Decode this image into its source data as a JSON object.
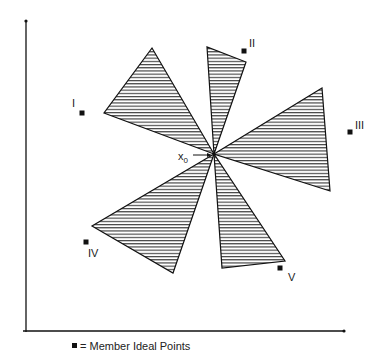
{
  "figure": {
    "center_label": "x",
    "center_subscript": "0",
    "legend_symbol": "square-marker",
    "legend_text": "= Member Ideal Points",
    "colors": {
      "line": "#111111",
      "hatch": "#222222",
      "background": "#ffffff"
    }
  },
  "ideal_points": [
    {
      "label": "I",
      "x": 82,
      "y": 113
    },
    {
      "label": "II",
      "x": 244,
      "y": 51
    },
    {
      "label": "III",
      "x": 350,
      "y": 132
    },
    {
      "label": "IV",
      "x": 86,
      "y": 242
    },
    {
      "label": "V",
      "x": 280,
      "y": 268
    }
  ],
  "center": {
    "x": 214,
    "y": 154
  },
  "triangles": [
    {
      "for": "I",
      "points": [
        [
          214,
          154
        ],
        [
          104,
          113
        ],
        [
          152,
          48
        ]
      ]
    },
    {
      "for": "II",
      "points": [
        [
          214,
          154
        ],
        [
          207,
          47
        ],
        [
          246,
          62
        ]
      ]
    },
    {
      "for": "III",
      "points": [
        [
          214,
          154
        ],
        [
          322,
          88
        ],
        [
          330,
          191
        ]
      ]
    },
    {
      "for": "IV",
      "points": [
        [
          214,
          154
        ],
        [
          92,
          226
        ],
        [
          173,
          273
        ]
      ]
    },
    {
      "for": "V",
      "points": [
        [
          214,
          154
        ],
        [
          222,
          268
        ],
        [
          285,
          261
        ]
      ]
    }
  ]
}
